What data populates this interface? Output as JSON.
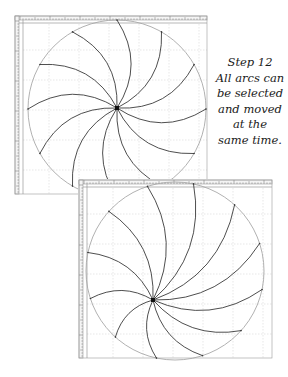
{
  "caption": {
    "lines": [
      "Step 12",
      "All arcs can",
      "be selected",
      "and moved",
      "at the",
      "same time."
    ]
  },
  "colors": {
    "background": "#ffffff",
    "panel_border": "#9a9a9a",
    "ruler_fill": "#f4f4f4",
    "ruler_tick": "#6a6a6a",
    "grid": "#d6d6d6",
    "circle": "#a8a8a8",
    "arc": "#3a3a3a",
    "center": "#111111"
  },
  "panels": [
    {
      "name": "top",
      "x": 15,
      "y": 16,
      "w": 192,
      "h": 178,
      "ruler": 4,
      "circle": {
        "cx": 117,
        "cy": 109,
        "r": 89
      },
      "hub": {
        "x": 117,
        "y": 108
      },
      "arc_count": 12,
      "arc_start_deg": -90,
      "arc_bulge": 0.32
    },
    {
      "name": "bottom",
      "x": 79,
      "y": 180,
      "w": 193,
      "h": 178,
      "ruler": 4,
      "circle": {
        "cx": 175,
        "cy": 271,
        "r": 89
      },
      "hub": {
        "x": 153,
        "y": 300
      },
      "arc_count": 12,
      "arc_start_deg": -78,
      "arc_bulge": 0.28
    }
  ]
}
